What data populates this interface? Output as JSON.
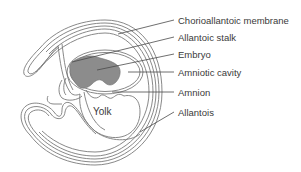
{
  "diagram": {
    "type": "labeled anatomical diagram",
    "colors": {
      "outline": "#7a7a7a",
      "embryo_fill": "#8c8c8c",
      "label_text": "#3a3a3a",
      "leader_line": "#4a4a4a"
    },
    "inner_label": "Yolk",
    "labels": [
      {
        "id": "chorioallantoic-membrane",
        "text": "Chorioallantoic membrane"
      },
      {
        "id": "allantoic-stalk",
        "text": "Allantoic stalk"
      },
      {
        "id": "embryo",
        "text": "Embryo"
      },
      {
        "id": "amniotic-cavity",
        "text": "Amniotic cavity"
      },
      {
        "id": "amnion",
        "text": "Amnion"
      },
      {
        "id": "allantois",
        "text": "Allantois"
      }
    ]
  }
}
